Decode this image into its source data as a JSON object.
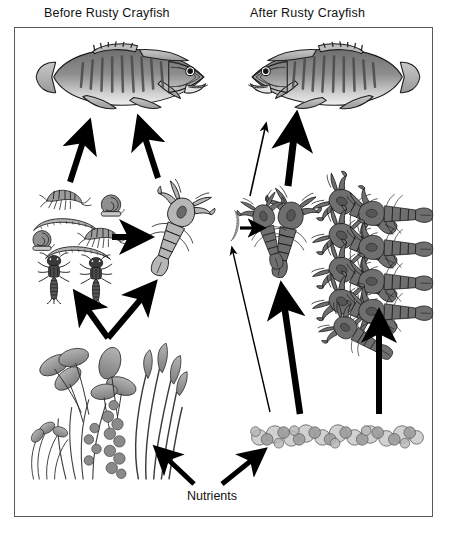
{
  "figure": {
    "title_before": "Before Rusty Crayfish",
    "title_after": "After Rusty Crayfish",
    "nutrients_label": "Nutrients",
    "caption": "",
    "frame_color": "#5a5a5a",
    "background": "#ffffff"
  },
  "panels": {
    "before": {
      "name": "before-rusty-crayfish-panel",
      "nodes": [
        {
          "id": "fish-before",
          "label": "Smallmouth bass",
          "role": "predatory fish",
          "abundance": "high",
          "facing": "right"
        },
        {
          "id": "invertebrates-before",
          "label": "Benthic invertebrates",
          "role": "macroinvertebrates",
          "abundance": "high",
          "members": [
            "amphipod-scud",
            "snail",
            "worm-larva",
            "mayfly-nymph"
          ]
        },
        {
          "id": "crayfish-native",
          "label": "Native crayfish",
          "role": "omnivore",
          "abundance": "moderate",
          "shade": "light"
        },
        {
          "id": "plants-before",
          "label": "Aquatic plants",
          "role": "macrophyte bed",
          "abundance": "abundant"
        }
      ],
      "links": [
        {
          "from": "invertebrates-before",
          "to": "fish-before",
          "strength": "strong"
        },
        {
          "from": "crayfish-native",
          "to": "fish-before",
          "strength": "strong"
        },
        {
          "from": "invertebrates-before",
          "to": "crayfish-native",
          "strength": "strong"
        },
        {
          "from": "plants-before",
          "to": "invertebrates-before",
          "strength": "strong"
        },
        {
          "from": "plants-before",
          "to": "crayfish-native",
          "strength": "strong"
        },
        {
          "from": "nutrients",
          "to": "plants-before",
          "strength": "strong"
        }
      ]
    },
    "after": {
      "name": "after-rusty-crayfish-panel",
      "nodes": [
        {
          "id": "fish-after",
          "label": "Smallmouth bass",
          "role": "predatory fish",
          "abundance": "reduced",
          "facing": "left"
        },
        {
          "id": "invertebrates-after",
          "label": "Benthic invertebrates",
          "role": "macroinvertebrates",
          "abundance": "depleted",
          "members": [
            "worm-larva"
          ]
        },
        {
          "id": "crayfish-rusty-few",
          "label": "Rusty crayfish",
          "role": "invasive omnivore",
          "abundance": "present",
          "shade": "dark"
        },
        {
          "id": "crayfish-rusty-swarm",
          "label": "Rusty crayfish aggregation",
          "role": "invasive omnivore",
          "abundance": "very high",
          "shade": "dark"
        },
        {
          "id": "rocks-after",
          "label": "Bare rock substrate",
          "role": "denuded bottom",
          "abundance": "plants eliminated"
        }
      ],
      "links": [
        {
          "from": "invertebrates-after",
          "to": "fish-after",
          "strength": "weak"
        },
        {
          "from": "crayfish-rusty-few",
          "to": "fish-after",
          "strength": "strong"
        },
        {
          "from": "invertebrates-after",
          "to": "crayfish-rusty-few",
          "strength": "strong"
        },
        {
          "from": "rocks-after",
          "to": "invertebrates-after",
          "strength": "weak"
        },
        {
          "from": "rocks-after",
          "to": "crayfish-rusty-few",
          "strength": "strong"
        },
        {
          "from": "rocks-after",
          "to": "crayfish-rusty-swarm",
          "strength": "strong"
        },
        {
          "from": "nutrients",
          "to": "rocks-after",
          "strength": "strong"
        }
      ]
    }
  },
  "legend_semantics": {
    "thick_arrow": "strong energy flow / strong trophic link",
    "thin_arrow": "weak energy flow / reduced trophic link"
  }
}
